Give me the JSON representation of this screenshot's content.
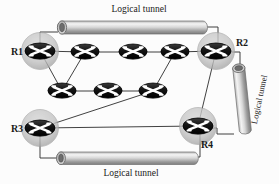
{
  "diagram": {
    "background_color": "#fcfcfc",
    "line_color": "#2b2b2b",
    "router_fill": "#111111",
    "router_mark_color": "#ffffff",
    "halo_color": "#bdbdbd",
    "tunnel_light": "#f2f2f2",
    "tunnel_dark": "#8a8a8a"
  },
  "labels": {
    "r1": "R1",
    "r2": "R2",
    "r3": "R3",
    "r4": "R4",
    "tunnel_top": "Logical tunnel",
    "tunnel_bottom": "Logical tunnel",
    "tunnel_right": "Logical tunnel"
  },
  "nodes": [
    {
      "id": "R1",
      "label": "R1",
      "x": 40,
      "y": 51,
      "halo": true
    },
    {
      "id": "R2",
      "label": "R2",
      "x": 216,
      "y": 51,
      "halo": true
    },
    {
      "id": "R3",
      "label": "R3",
      "x": 40,
      "y": 128,
      "halo": true
    },
    {
      "id": "R4",
      "label": "R4",
      "x": 198,
      "y": 126,
      "halo": true
    },
    {
      "id": "A",
      "label": "",
      "x": 85,
      "y": 52,
      "halo": false
    },
    {
      "id": "B",
      "label": "",
      "x": 133,
      "y": 52,
      "halo": false
    },
    {
      "id": "C",
      "label": "",
      "x": 175,
      "y": 52,
      "halo": false
    },
    {
      "id": "D",
      "label": "",
      "x": 62,
      "y": 91,
      "halo": false
    },
    {
      "id": "E",
      "label": "",
      "x": 108,
      "y": 91,
      "halo": false
    },
    {
      "id": "F",
      "label": "",
      "x": 153,
      "y": 91,
      "halo": false
    }
  ],
  "links": [
    {
      "from": "R1",
      "to": "A"
    },
    {
      "from": "A",
      "to": "B"
    },
    {
      "from": "B",
      "to": "C"
    },
    {
      "from": "C",
      "to": "R2"
    },
    {
      "from": "R1",
      "to": "D"
    },
    {
      "from": "A",
      "to": "D"
    },
    {
      "from": "D",
      "to": "E"
    },
    {
      "from": "E",
      "to": "F"
    },
    {
      "from": "F",
      "to": "C"
    },
    {
      "from": "F",
      "to": "R3"
    },
    {
      "from": "R3",
      "to": "R4"
    },
    {
      "from": "R2",
      "to": "R4"
    }
  ],
  "tunnels": [
    {
      "id": "tunnel-top",
      "label": "Logical tunnel",
      "orientation": "horizontal",
      "endpoints": [
        "R1",
        "R2"
      ]
    },
    {
      "id": "tunnel-bottom",
      "label": "Logical tunnel",
      "orientation": "horizontal",
      "endpoints": [
        "R3",
        "R4"
      ]
    },
    {
      "id": "tunnel-right",
      "label": "Logical tunnel",
      "orientation": "vertical",
      "endpoints": [
        "R2",
        "R4"
      ]
    }
  ]
}
